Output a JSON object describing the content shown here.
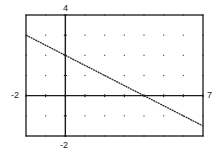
{
  "chart_data": {
    "type": "line",
    "title": "",
    "xlabel": "",
    "ylabel": "",
    "xlim": [
      -2,
      7
    ],
    "ylim": [
      -2,
      4
    ],
    "xscale": 1,
    "yscale": 1,
    "grid": "dots",
    "series": [
      {
        "name": "y = -0.5x + 2",
        "slope": -0.5,
        "intercept": 2,
        "x": [
          -2,
          0,
          4,
          7
        ],
        "y": [
          3,
          2,
          0,
          -1.5
        ]
      }
    ]
  },
  "labels": {
    "ymax": "4",
    "ymin": "-2",
    "xmin": "-2",
    "xmax": "7"
  },
  "colors": {
    "frame": "#1a1a1a",
    "axis": "#1a1a1a",
    "line": "#2a2a2a",
    "grid": "#555555"
  }
}
